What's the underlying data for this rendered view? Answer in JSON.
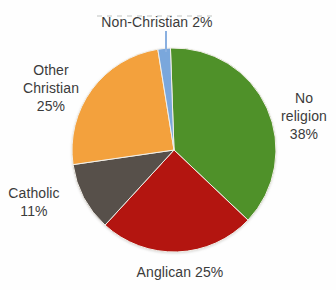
{
  "chart_data": {
    "type": "pie",
    "title": "",
    "unit": "%",
    "direction": "clockwise",
    "start_angle_deg": -2,
    "legend": "none",
    "slices": [
      {
        "label": "No religion",
        "value": 38,
        "color": "#4F9129"
      },
      {
        "label": "Anglican",
        "value": 25,
        "color": "#B31510"
      },
      {
        "label": "Catholic",
        "value": 11,
        "color": "#57504A"
      },
      {
        "label": "Other Christian",
        "value": 25,
        "color": "#F3A13D"
      },
      {
        "label": "Non-Christian",
        "value": 2,
        "color": "#7AA7DC"
      }
    ]
  },
  "labels": {
    "non_christian": {
      "text": "Non-Christian 2%"
    },
    "other_christian": {
      "line1": "Other",
      "line2": "Christian",
      "line3": "25%"
    },
    "no_religion": {
      "line1": "No",
      "line2": "religion",
      "line3": "38%"
    },
    "catholic": {
      "line1": "Catholic",
      "line2": "11%"
    },
    "anglican": {
      "text": "Anglican 25%"
    }
  },
  "colors": {
    "label_text": "#3B3B3B",
    "leader_line": "#8AB0E0",
    "slice_border": "#F2EFE8",
    "background": "#FEFEFE"
  },
  "geometry": {
    "pie_center_x": 174,
    "pie_center_y": 150,
    "pie_radius": 102
  }
}
